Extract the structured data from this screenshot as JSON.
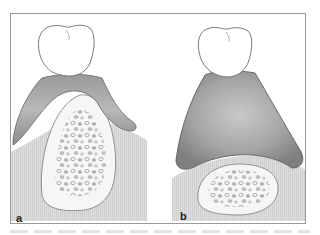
{
  "figure": {
    "panels": [
      {
        "id": "a",
        "label": "a",
        "description": "Tooth with thin gingival saddle over tall alveolar ridge with cancellous bone"
      },
      {
        "id": "b",
        "label": "b",
        "description": "Tooth with thick gingival/soft tissue mass over resorbed low ridge with small cancellous bone area"
      }
    ],
    "colors": {
      "frame": "#9a9a9a",
      "background_tissue": "#dcdcdc",
      "gum_dark": "#8c8c8c",
      "gum_light": "#bdbdbd",
      "bone_cortex": "#f7f7f7",
      "trabeculae": "#a8a8a8",
      "tooth": "#ffffff",
      "outline": "#6e6e6e"
    }
  }
}
